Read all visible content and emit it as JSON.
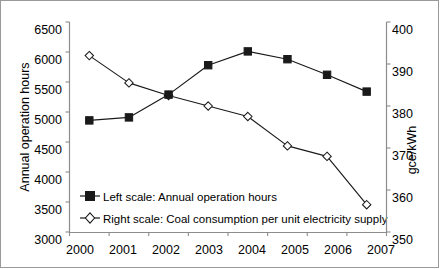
{
  "chart_data": {
    "type": "line",
    "title": "",
    "subtitle": "",
    "xlabel": "",
    "ylabel": "Annual operation hours",
    "y2label": "gce/kWh",
    "categories": [
      "2000",
      "2001",
      "2002",
      "2003",
      "2004",
      "2005",
      "2006",
      "2007"
    ],
    "ylim": [
      3000,
      6500
    ],
    "y2lim": [
      350,
      400
    ],
    "ytick_step": 500,
    "y2tick_step": 10,
    "yticks": [
      "3000",
      "3500",
      "4000",
      "4500",
      "5000",
      "5500",
      "6000",
      "6500"
    ],
    "y2ticks": [
      "350",
      "360",
      "370",
      "380",
      "390",
      "400"
    ],
    "grid": false,
    "legend_position": "inside-lower-left",
    "series": [
      {
        "name": "Left scale: Annual operation hours",
        "axis": "left",
        "marker": "filled-square",
        "values": [
          4860,
          4910,
          5290,
          5780,
          6010,
          5880,
          5620,
          5340
        ]
      },
      {
        "name": "Right scale: Coal consumption per unit electricity supply",
        "axis": "right",
        "marker": "open-diamond",
        "values": [
          392.0,
          385.5,
          382.5,
          380.0,
          377.5,
          370.5,
          368.0,
          356.5
        ]
      }
    ]
  },
  "legend": {
    "entry_left_label": "Left scale: Annual operation hours",
    "entry_right_label": "Right scale: Coal consumption per unit electricity supply"
  },
  "axes": {
    "left_title": "Annual operation hours",
    "right_title": "gce/kWh"
  },
  "colors": {
    "line": "#1a1a1a",
    "axis": "#8c8c8c",
    "text": "#000000",
    "background": "#ffffff"
  }
}
